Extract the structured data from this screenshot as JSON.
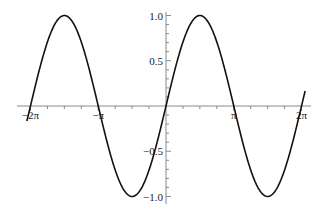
{
  "chart_data": {
    "type": "line",
    "title": "",
    "xlabel": "",
    "ylabel": "",
    "function": "sin(x)",
    "xlim": [
      -6.45,
      6.45
    ],
    "ylim": [
      -1.0,
      1.0
    ],
    "grid": false,
    "legend": null,
    "x_ticks": [
      {
        "value": -6.2832,
        "label": "-2π"
      },
      {
        "value": -3.1416,
        "label": "-π"
      },
      {
        "value": 3.1416,
        "label": "π"
      },
      {
        "value": 6.2832,
        "label": "2π"
      }
    ],
    "y_ticks": [
      {
        "value": 1.0,
        "label": "1.0"
      },
      {
        "value": 0.5,
        "label": "0.5"
      },
      {
        "value": -0.5,
        "label": "-0.5"
      },
      {
        "value": -1.0,
        "label": "-1.0"
      }
    ],
    "series": [
      {
        "name": "sin(x)",
        "color": "#111111",
        "x": [
          -6.45,
          -6.2832,
          -5.4978,
          -4.7124,
          -3.927,
          -3.1416,
          -2.3562,
          -1.5708,
          -0.7854,
          0,
          0.7854,
          1.5708,
          2.3562,
          3.1416,
          3.927,
          4.7124,
          5.4978,
          6.2832,
          6.45
        ],
        "y": [
          -0.166,
          0,
          0.707,
          1,
          0.707,
          0,
          -0.707,
          -1,
          -0.707,
          0,
          0.707,
          1,
          0.707,
          0,
          -0.707,
          -1,
          -0.707,
          0,
          0.166
        ]
      }
    ]
  },
  "layout": {
    "origin_px": [
      166,
      106
    ],
    "px_per_x_unit": 21.57,
    "px_per_y_unit": 90.5,
    "x_axis_px": [
      17,
      311
    ],
    "y_axis_px": [
      12,
      204
    ]
  }
}
